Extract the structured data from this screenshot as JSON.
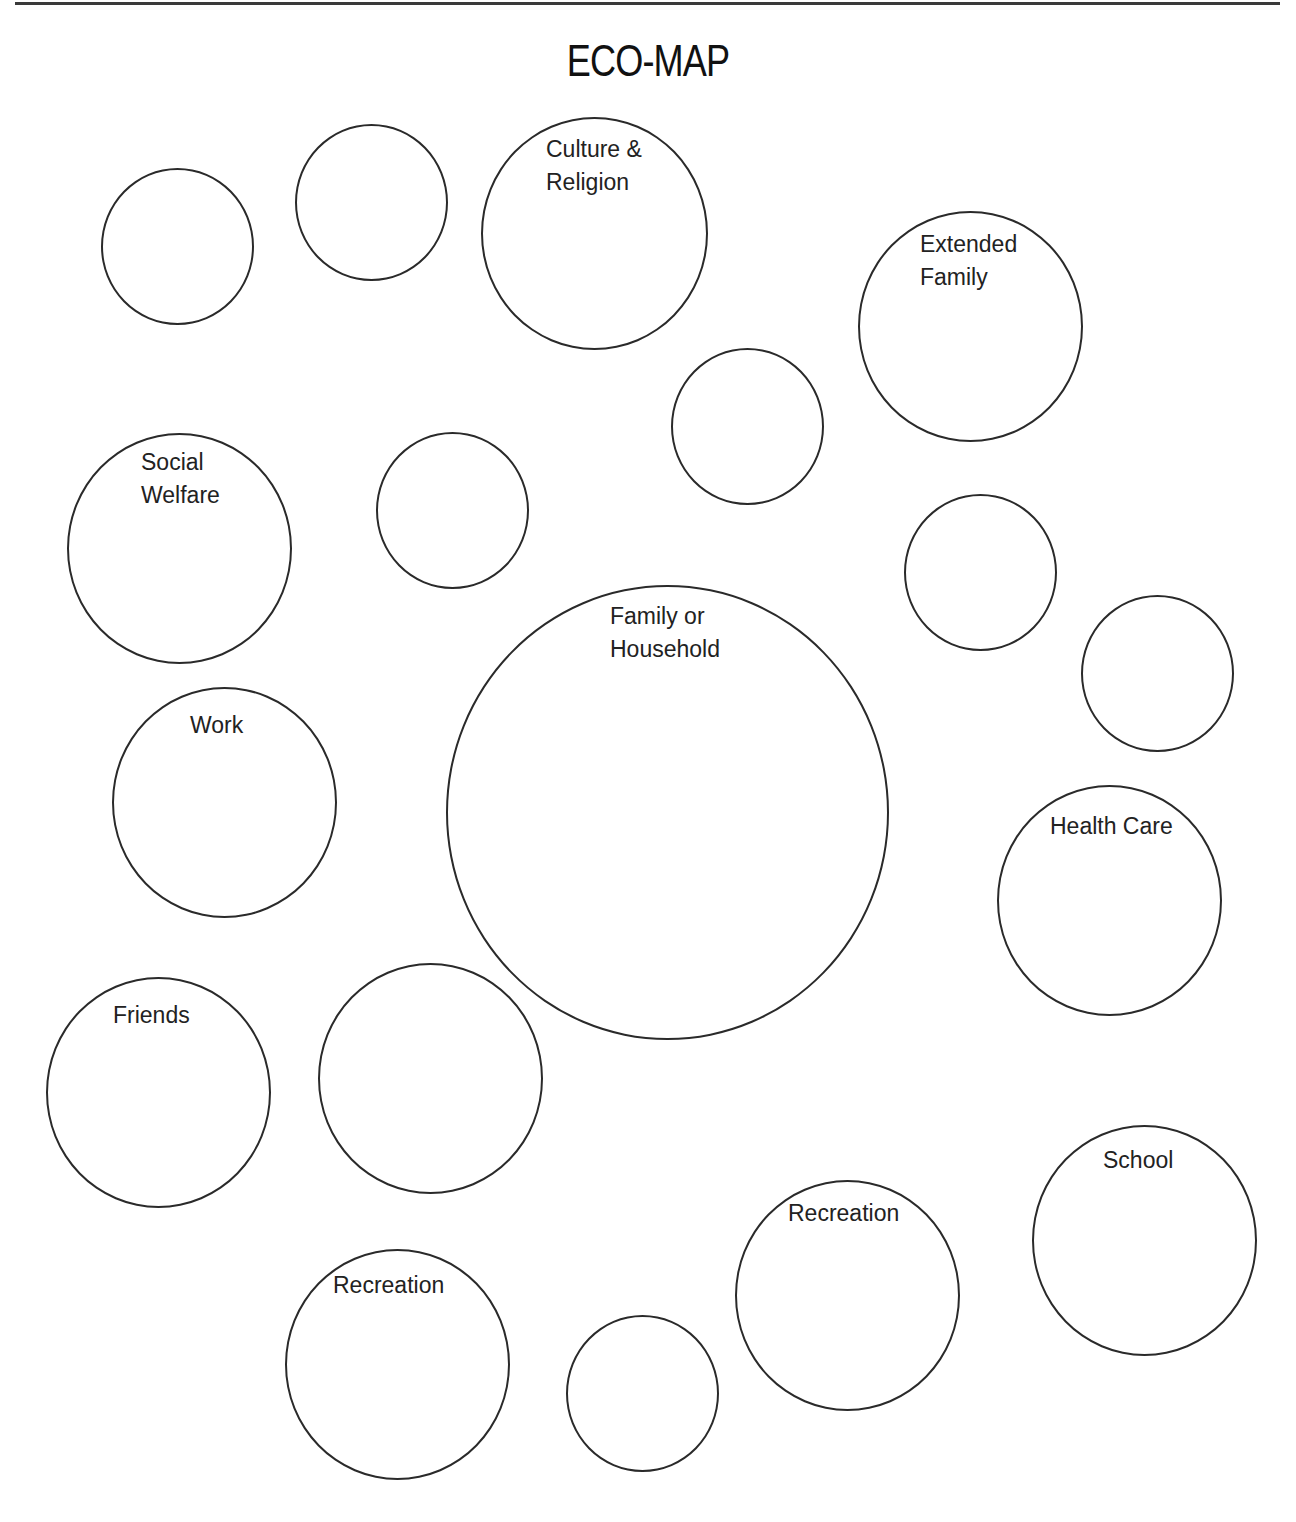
{
  "header": {
    "title": "ECO-MAP"
  },
  "circles": [
    {
      "id": "blank-1",
      "label": "",
      "cx": 177,
      "cy": 246,
      "rx": 76,
      "ry": 78
    },
    {
      "id": "blank-2",
      "label": "",
      "cx": 371,
      "cy": 202,
      "rx": 76,
      "ry": 78
    },
    {
      "id": "culture-religion",
      "label": "Culture &\nReligion",
      "cx": 594,
      "cy": 233,
      "rx": 113,
      "ry": 116
    },
    {
      "id": "extended-family",
      "label": "Extended\nFamily",
      "cx": 970,
      "cy": 326,
      "rx": 112,
      "ry": 115
    },
    {
      "id": "blank-3",
      "label": "",
      "cx": 747,
      "cy": 426,
      "rx": 76,
      "ry": 78
    },
    {
      "id": "social-welfare",
      "label": "Social\nWelfare",
      "cx": 179,
      "cy": 548,
      "rx": 112,
      "ry": 115
    },
    {
      "id": "blank-4",
      "label": "",
      "cx": 452,
      "cy": 510,
      "rx": 76,
      "ry": 78
    },
    {
      "id": "blank-5",
      "label": "",
      "cx": 980,
      "cy": 572,
      "rx": 76,
      "ry": 78
    },
    {
      "id": "family-household",
      "label": "Family or\nHousehold",
      "cx": 667,
      "cy": 812,
      "rx": 221,
      "ry": 227
    },
    {
      "id": "blank-6",
      "label": "",
      "cx": 1157,
      "cy": 673,
      "rx": 76,
      "ry": 78
    },
    {
      "id": "work",
      "label": "Work",
      "cx": 224,
      "cy": 802,
      "rx": 112,
      "ry": 115
    },
    {
      "id": "health-care",
      "label": "Health Care",
      "cx": 1109,
      "cy": 900,
      "rx": 112,
      "ry": 115
    },
    {
      "id": "friends",
      "label": "Friends",
      "cx": 158,
      "cy": 1092,
      "rx": 112,
      "ry": 115
    },
    {
      "id": "blank-7",
      "label": "",
      "cx": 430,
      "cy": 1078,
      "rx": 112,
      "ry": 115
    },
    {
      "id": "school",
      "label": "School",
      "cx": 1144,
      "cy": 1240,
      "rx": 112,
      "ry": 115
    },
    {
      "id": "recreation-right",
      "label": "Recreation",
      "cx": 846,
      "cy": 1295,
      "rx": 112,
      "ry": 115
    },
    {
      "id": "recreation-left",
      "label": "Recreation",
      "cx": 397,
      "cy": 1364,
      "rx": 112,
      "ry": 115
    },
    {
      "id": "blank-8",
      "label": "",
      "cx": 642,
      "cy": 1393,
      "rx": 76,
      "ry": 78
    }
  ],
  "labels": {
    "culture_religion": "Culture &\nReligion",
    "extended_family": "Extended\nFamily",
    "social_welfare": "Social\nWelfare",
    "family_household": "Family or\nHousehold",
    "work": "Work",
    "health_care": "Health Care",
    "friends": "Friends",
    "school": "School",
    "recreation_right": "Recreation",
    "recreation_left": "Recreation"
  }
}
